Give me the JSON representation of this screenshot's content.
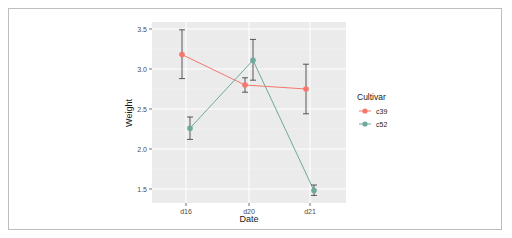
{
  "chart_data": {
    "type": "line",
    "title": "",
    "xlabel": "Date",
    "ylabel": "Weight",
    "categories": [
      "d16",
      "d20",
      "d21"
    ],
    "yticks": [
      "1.5",
      "2.0",
      "2.5",
      "3.0",
      "3.5"
    ],
    "ylim": [
      1.32,
      3.56
    ],
    "grid": true,
    "legend": {
      "title": "Cultivar",
      "position": "right"
    },
    "series": [
      {
        "name": "c39",
        "color": "#F8766D",
        "values": [
          3.18,
          2.8,
          2.75
        ],
        "err_low": [
          2.88,
          2.71,
          2.44
        ],
        "err_high": [
          3.49,
          2.89,
          3.06
        ]
      },
      {
        "name": "c52",
        "color": "#6FA89D",
        "values": [
          2.26,
          3.11,
          1.48
        ],
        "err_low": [
          2.12,
          2.86,
          1.42
        ],
        "err_high": [
          2.4,
          3.37,
          1.55
        ]
      }
    ]
  }
}
